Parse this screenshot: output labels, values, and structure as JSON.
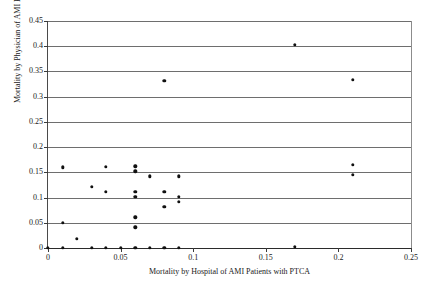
{
  "chart_data": {
    "type": "scatter",
    "title": "",
    "xlabel": "Mortality by Hospital of AMI Patients with PTCA",
    "ylabel": "Mortality by Physician of AMI Patients with PTCA",
    "xlim": [
      0,
      0.25
    ],
    "ylim": [
      0,
      0.45
    ],
    "xticks": [
      0,
      0.05,
      0.1,
      0.15,
      0.2,
      0.25
    ],
    "xticklabels": [
      "0",
      "0.05",
      "0.1",
      "0.15",
      "0.2",
      "0.25"
    ],
    "yticks": [
      0,
      0.05,
      0.1,
      0.15,
      0.2,
      0.25,
      0.3,
      0.35,
      0.4,
      0.45
    ],
    "yticklabels": [
      "0",
      "0.05",
      "0.1",
      "0.15",
      "0.2",
      "0.25",
      "0.3",
      "0.35",
      "0.4",
      "0.45"
    ],
    "grid": "horizontal",
    "legend": "none",
    "marker": "filled-circle",
    "marker_color": "#111111",
    "points": [
      {
        "x": 0.0,
        "y": 0.0
      },
      {
        "x": 0.01,
        "y": 0.0
      },
      {
        "x": 0.01,
        "y": 0.05
      },
      {
        "x": 0.01,
        "y": 0.16
      },
      {
        "x": 0.02,
        "y": 0.018
      },
      {
        "x": 0.03,
        "y": 0.0
      },
      {
        "x": 0.03,
        "y": 0.121
      },
      {
        "x": 0.04,
        "y": 0.0
      },
      {
        "x": 0.04,
        "y": 0.111
      },
      {
        "x": 0.04,
        "y": 0.161
      },
      {
        "x": 0.05,
        "y": 0.0
      },
      {
        "x": 0.06,
        "y": 0.0
      },
      {
        "x": 0.06,
        "y": 0.041
      },
      {
        "x": 0.06,
        "y": 0.061
      },
      {
        "x": 0.06,
        "y": 0.101
      },
      {
        "x": 0.06,
        "y": 0.111
      },
      {
        "x": 0.06,
        "y": 0.152
      },
      {
        "x": 0.06,
        "y": 0.162
      },
      {
        "x": 0.07,
        "y": 0.0
      },
      {
        "x": 0.07,
        "y": 0.142
      },
      {
        "x": 0.08,
        "y": 0.0
      },
      {
        "x": 0.08,
        "y": 0.082
      },
      {
        "x": 0.08,
        "y": 0.111
      },
      {
        "x": 0.08,
        "y": 0.332
      },
      {
        "x": 0.09,
        "y": 0.0
      },
      {
        "x": 0.09,
        "y": 0.092
      },
      {
        "x": 0.09,
        "y": 0.102
      },
      {
        "x": 0.09,
        "y": 0.142
      },
      {
        "x": 0.17,
        "y": 0.002
      },
      {
        "x": 0.17,
        "y": 0.403
      },
      {
        "x": 0.21,
        "y": 0.145
      },
      {
        "x": 0.21,
        "y": 0.165
      },
      {
        "x": 0.21,
        "y": 0.334
      }
    ]
  }
}
